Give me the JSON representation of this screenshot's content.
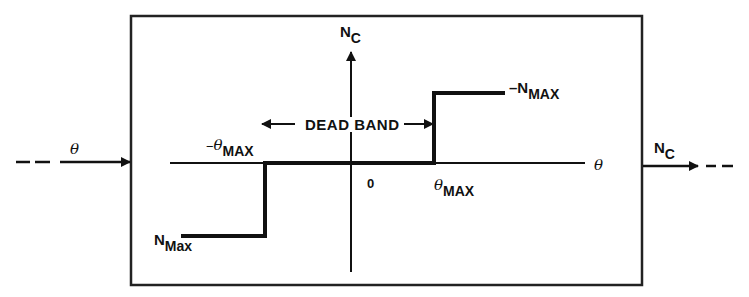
{
  "diagram": {
    "type": "dead-band nonlinearity block",
    "input": {
      "label": "θ"
    },
    "output": {
      "label_main": "N",
      "label_sub": "C"
    },
    "axes": {
      "vertical": {
        "label_main": "N",
        "label_sub": "C"
      },
      "horizontal": {
        "label": "θ"
      },
      "origin_label": "0"
    },
    "dead_band_label": "DEAD BAND",
    "levels": {
      "upper": {
        "prefix": "–N",
        "sub": "MAX"
      },
      "lower": {
        "main": "N",
        "sub": "Max"
      }
    },
    "thresholds": {
      "negative": {
        "prefix": "–θ",
        "sub": "MAX"
      },
      "positive": {
        "prefix": "θ",
        "sub": "MAX"
      }
    },
    "colors": {
      "line": "#111111",
      "background": "#ffffff"
    }
  }
}
